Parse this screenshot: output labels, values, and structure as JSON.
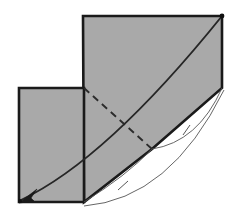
{
  "figure": {
    "canvas": {
      "width": 236,
      "height": 219,
      "background": "#ffffff"
    },
    "colors": {
      "fill_gray": "#a9a9a9",
      "outline_dark": "#1a1a1a",
      "curve_dark": "#262626",
      "thin_arc": "#555555",
      "dashed": "#2b2b2b",
      "background": "#ffffff"
    },
    "shapes": [
      {
        "name": "left-rectangle",
        "type": "polygon",
        "points": "19,88 84,88 84,202 19,202",
        "fill": "#a9a9a9",
        "stroke": "#1a1a1a",
        "stroke_width": 2.6
      },
      {
        "name": "large-quadrilateral",
        "type": "polygon",
        "points": "83,16 222,16 222,88 152,149 84,202",
        "fill": "#a9a9a9",
        "stroke": "#1a1a1a",
        "stroke_width": 2.6
      }
    ],
    "curves": [
      {
        "name": "main-arc-curve",
        "type": "quadratic-bezier",
        "start": "20,201",
        "control": "104,158",
        "end": "222,16",
        "stroke": "#262626",
        "stroke_width": 1.9,
        "has_arrowhead": true,
        "arrow_at": "start"
      },
      {
        "name": "thin-arc-lower",
        "type": "quadratic-bezier",
        "start": "84,202",
        "control": "124,173",
        "end": "152,149",
        "stroke": "#555555",
        "stroke_width": 0.9
      },
      {
        "name": "thin-arc-upper",
        "type": "quadratic-bezier",
        "start": "152,149",
        "control": "196,139",
        "end": "222,88",
        "stroke": "#555555",
        "stroke_width": 0.9
      },
      {
        "name": "outer-sweep-arc",
        "type": "quadratic-bezier",
        "start": "84,207",
        "control": "168,198",
        "end": "224,90",
        "stroke": "#555555",
        "stroke_width": 0.9
      }
    ],
    "dashed_lines": [
      {
        "name": "hidden-edge-dashed",
        "from": "84,88",
        "to": "152,149",
        "stroke": "#2b2b2b",
        "stroke_width": 1.9,
        "dash_pattern": "7,5"
      }
    ],
    "tick_marks": [
      {
        "name": "congruence-tick-lower",
        "x": 123,
        "y": 186,
        "angle": 42
      },
      {
        "name": "congruence-tick-upper",
        "x": 187,
        "y": 130,
        "angle": 70
      }
    ],
    "vertex_dots": [
      {
        "name": "vertex-dot-top-right",
        "cx": 222,
        "cy": 16,
        "r": 2.3
      },
      {
        "name": "vertex-dot-bottom-left",
        "cx": 20,
        "cy": 201,
        "r": 2.0
      }
    ],
    "arrowhead": {
      "name": "curve-arrowhead",
      "points": "20,201 35,190 30,198 33,200",
      "tip": "20,201"
    }
  }
}
